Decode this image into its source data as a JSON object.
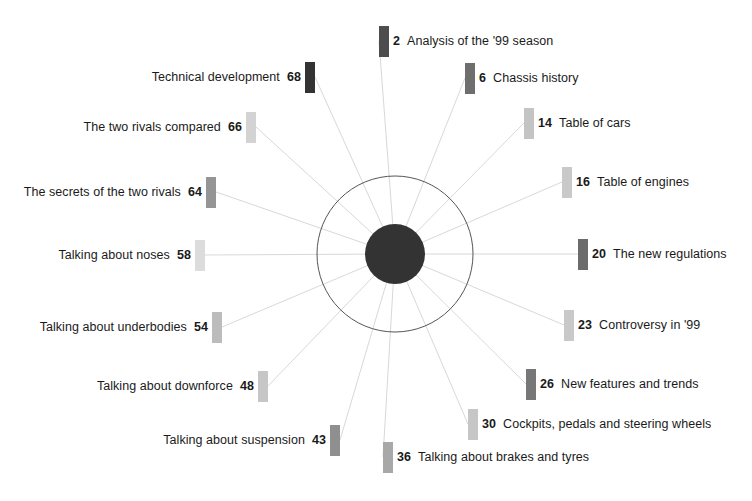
{
  "diagram": {
    "type": "radial-spoke-wheel",
    "title": "",
    "center": {
      "inner_circle_color": "#333333",
      "inner_circle_radius": 30,
      "outer_circle_radius": 78,
      "outer_circle_stroke": "#555555",
      "cx": 395,
      "cy": 254
    },
    "spoke_color": "#d8d8d8",
    "background": "#ffffff",
    "entries": [
      {
        "page": "2",
        "title": "Analysis of the '99 season",
        "color": "#4d4d4d",
        "side": "right",
        "swatch_x": 379,
        "swatch_y": 26,
        "anchor_x": 379,
        "anchor_y": 41
      },
      {
        "page": "6",
        "title": "Chassis history",
        "color": "#6e6e6e",
        "side": "right",
        "swatch_x": 465,
        "swatch_y": 63,
        "anchor_x": 465,
        "anchor_y": 78
      },
      {
        "page": "14",
        "title": "Table of cars",
        "color": "#c4c4c4",
        "side": "right",
        "swatch_x": 524,
        "swatch_y": 108,
        "anchor_x": 524,
        "anchor_y": 123
      },
      {
        "page": "16",
        "title": "Table of engines",
        "color": "#c9c9c9",
        "side": "right",
        "swatch_x": 562,
        "swatch_y": 167,
        "anchor_x": 562,
        "anchor_y": 182
      },
      {
        "page": "20",
        "title": "The new regulations",
        "color": "#6b6b6b",
        "side": "right",
        "swatch_x": 578,
        "swatch_y": 239,
        "anchor_x": 578,
        "anchor_y": 254
      },
      {
        "page": "23",
        "title": "Controversy in '99",
        "color": "#c9c9c9",
        "side": "right",
        "swatch_x": 564,
        "swatch_y": 310,
        "anchor_x": 564,
        "anchor_y": 325
      },
      {
        "page": "26",
        "title": "New features and trends",
        "color": "#777777",
        "side": "right",
        "swatch_x": 526,
        "swatch_y": 369,
        "anchor_x": 526,
        "anchor_y": 384
      },
      {
        "page": "30",
        "title": "Cockpits, pedals and steering wheels",
        "color": "#c6c6c6",
        "side": "right",
        "swatch_x": 468,
        "swatch_y": 409,
        "anchor_x": 468,
        "anchor_y": 424
      },
      {
        "page": "36",
        "title": "Talking about brakes and tyres",
        "color": "#a8a8a8",
        "side": "right",
        "swatch_x": 383,
        "swatch_y": 442,
        "anchor_x": 383,
        "anchor_y": 457
      },
      {
        "page": "43",
        "title": "Talking about suspension",
        "color": "#8f8f8f",
        "side": "left",
        "swatch_x": 330,
        "swatch_y": 425,
        "anchor_x": 340,
        "anchor_y": 440
      },
      {
        "page": "48",
        "title": "Talking about downforce",
        "color": "#c6c6c6",
        "side": "left",
        "swatch_x": 258,
        "swatch_y": 371,
        "anchor_x": 268,
        "anchor_y": 386
      },
      {
        "page": "54",
        "title": "Talking about underbodies",
        "color": "#bcbcbc",
        "side": "left",
        "swatch_x": 212,
        "swatch_y": 312,
        "anchor_x": 222,
        "anchor_y": 327
      },
      {
        "page": "58",
        "title": "Talking about noses",
        "color": "#dcdcdc",
        "side": "left",
        "swatch_x": 195,
        "swatch_y": 240,
        "anchor_x": 205,
        "anchor_y": 255
      },
      {
        "page": "64",
        "title": "The secrets of the two rivals",
        "color": "#959595",
        "side": "left",
        "swatch_x": 206,
        "swatch_y": 177,
        "anchor_x": 216,
        "anchor_y": 192
      },
      {
        "page": "66",
        "title": "The two rivals compared",
        "color": "#d3d3d3",
        "side": "left",
        "swatch_x": 246,
        "swatch_y": 112,
        "anchor_x": 256,
        "anchor_y": 127
      },
      {
        "page": "68",
        "title": "Technical development",
        "color": "#333333",
        "side": "left",
        "swatch_x": 305,
        "swatch_y": 62,
        "anchor_x": 315,
        "anchor_y": 77
      }
    ]
  }
}
